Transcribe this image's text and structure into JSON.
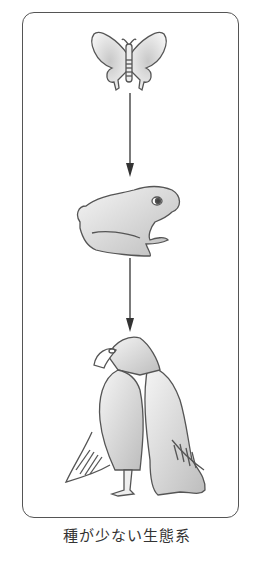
{
  "diagram": {
    "type": "food-chain",
    "nodes": [
      {
        "id": "butterfly",
        "label": "butterfly"
      },
      {
        "id": "frog",
        "label": "frog"
      },
      {
        "id": "eagle",
        "label": "eagle"
      }
    ],
    "edges": [
      {
        "from": "butterfly",
        "to": "frog"
      },
      {
        "from": "frog",
        "to": "eagle"
      }
    ],
    "caption": "種が少ない生態系"
  }
}
